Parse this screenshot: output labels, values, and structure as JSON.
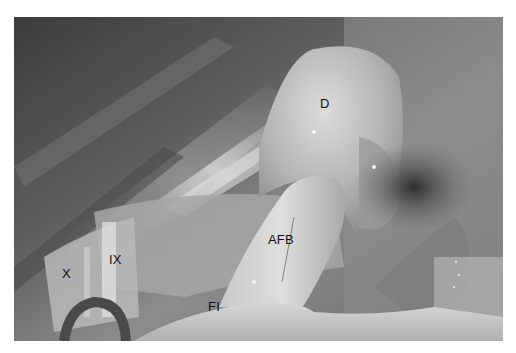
{
  "figure": {
    "type": "intraoperative photograph (grayscale)",
    "labels": [
      {
        "id": "D",
        "text": "D",
        "x": 320,
        "y": 97
      },
      {
        "id": "AFB",
        "text": "AFB",
        "x": 268,
        "y": 233
      },
      {
        "id": "IX",
        "text": "IX",
        "x": 109,
        "y": 253
      },
      {
        "id": "X",
        "text": "X",
        "x": 62,
        "y": 267
      },
      {
        "id": "FI",
        "text": "FI",
        "x": 208,
        "y": 300
      }
    ]
  },
  "colors": {
    "background": "#ffffff",
    "label_text": "#111111",
    "tissue_dark": "#3a3a3a",
    "tissue_mid": "#8a8a8a",
    "tissue_light": "#d8d8d8"
  }
}
